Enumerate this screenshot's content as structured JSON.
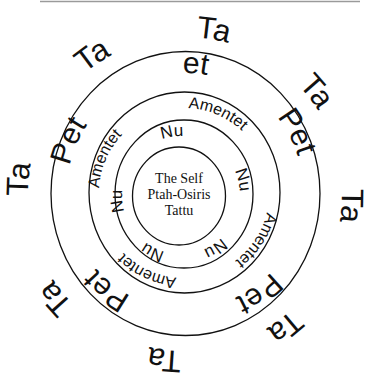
{
  "diagram": {
    "center": {
      "lines": [
        "The Self",
        "Ptah-Osiris",
        "Tattu"
      ]
    },
    "rings": [
      {
        "name": "nu",
        "label": "Nu",
        "angles": [
          -9,
          76,
          147,
          206,
          264
        ]
      },
      {
        "name": "amentet",
        "label": "Amentet",
        "angles": [
          23,
          123,
          205,
          293
        ]
      },
      {
        "name": "pet",
        "label": "Pet",
        "angles": [
          0,
          62,
          144,
          218,
          293
        ]
      },
      {
        "name": "ta",
        "label": "Ta",
        "angles": [
          10,
          52,
          94,
          143,
          187,
          231,
          275,
          -34
        ]
      }
    ]
  },
  "labels": {
    "center_line1": "The Self",
    "center_line2": "Ptah-Osiris",
    "center_line3": "Tattu",
    "nu": "Nu",
    "amentet": "Amentet",
    "pet": "Pet",
    "ta": "Ta"
  }
}
